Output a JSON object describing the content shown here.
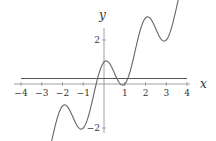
{
  "chart_data": {
    "type": "line",
    "title": "",
    "xlabel": "x",
    "ylabel": "y",
    "xlim": [
      -4,
      4
    ],
    "ylim": [
      -4.5,
      5.2
    ],
    "grid": false,
    "legend": null,
    "x_ticks": [
      -4,
      -3,
      -2,
      -1,
      1,
      2,
      3,
      4
    ],
    "x_tick_labels": [
      "-4",
      "-3",
      "-2",
      "-1",
      "1",
      "2",
      "3",
      "4"
    ],
    "y_ticks": [
      4,
      2,
      -2,
      -4
    ],
    "y_tick_labels": [
      "4",
      "2",
      "-2",
      "-4"
    ],
    "series": [
      {
        "name": "curve",
        "formula": "y = x + cos(pi*x)",
        "x": [
          -4,
          -3.5,
          -3,
          -2.5,
          -2,
          -1.5,
          -1,
          -0.5,
          0,
          0.5,
          1,
          1.5,
          2,
          2.5,
          3,
          3.5,
          4
        ],
        "y": [
          -3,
          -3.5,
          -4,
          -2.5,
          -1,
          -1.5,
          -2,
          -0.5,
          1,
          0.5,
          0,
          1.5,
          3,
          2.5,
          2,
          3.5,
          5
        ],
        "color": "#555555"
      },
      {
        "name": "horizontal-line",
        "formula": "y = 0.25",
        "x": [
          -4,
          4
        ],
        "y": [
          0.25,
          0.25
        ],
        "color": "#555555"
      }
    ]
  },
  "axes": {
    "x_title": "x",
    "y_title": "y"
  }
}
